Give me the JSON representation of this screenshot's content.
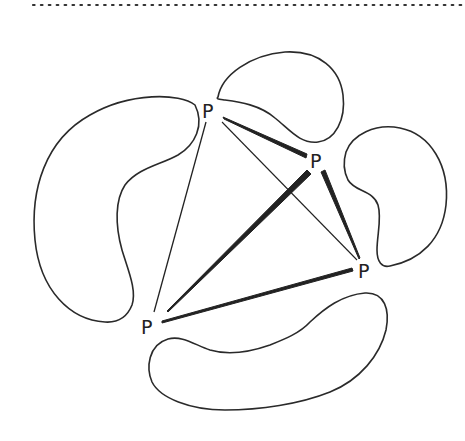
{
  "diagram": {
    "type": "graph",
    "header_rule": {
      "style": "dotted",
      "color": "#333333"
    },
    "nodes": [
      {
        "id": "p1",
        "label": "P",
        "x": 209,
        "y": 110
      },
      {
        "id": "p2",
        "label": "P",
        "x": 317,
        "y": 160
      },
      {
        "id": "p3",
        "label": "P",
        "x": 366,
        "y": 270
      },
      {
        "id": "p4",
        "label": "P",
        "x": 148,
        "y": 326
      }
    ],
    "edges": [
      {
        "from": "p1",
        "to": "p2",
        "weight": "thick"
      },
      {
        "from": "p1",
        "to": "p3",
        "weight": "thin"
      },
      {
        "from": "p1",
        "to": "p4",
        "weight": "thin"
      },
      {
        "from": "p2",
        "to": "p3",
        "weight": "thick"
      },
      {
        "from": "p2",
        "to": "p4",
        "weight": "thick"
      },
      {
        "from": "p4",
        "to": "p3",
        "weight": "medium"
      }
    ],
    "blobs": [
      {
        "id": "blob-top",
        "position": "top"
      },
      {
        "id": "blob-left",
        "position": "left"
      },
      {
        "id": "blob-right",
        "position": "right"
      },
      {
        "id": "blob-bottom",
        "position": "bottom"
      }
    ],
    "colors": {
      "stroke": "#222222",
      "background": "#ffffff"
    }
  }
}
